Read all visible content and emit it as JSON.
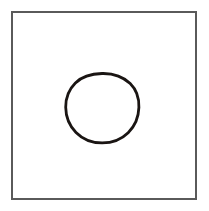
{
  "figure": {
    "title": "Circle inside a square frame",
    "caption": "",
    "background_color": "#ffffff",
    "canvas": {
      "width": 209,
      "height": 211
    },
    "shapes": [
      {
        "name": "square-frame",
        "type": "rectangle",
        "label": "Square frame",
        "x": 12,
        "y": 12,
        "width": 184,
        "height": 187,
        "stroke_color": "#5a5a5a",
        "stroke_width": 2,
        "fill": "none"
      },
      {
        "name": "circle-outline",
        "type": "circle",
        "label": "Circle",
        "cx": 102,
        "cy": 108,
        "r": 34.5,
        "stroke_color": "#1a1513",
        "stroke_width": 2.8,
        "fill": "none"
      }
    ]
  }
}
